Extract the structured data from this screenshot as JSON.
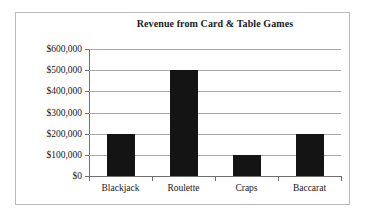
{
  "chart_data": {
    "type": "bar",
    "title": "Revenue from Card & Table Games",
    "xlabel": "",
    "ylabel": "",
    "categories": [
      "Blackjack",
      "Roulette",
      "Craps",
      "Baccarat"
    ],
    "values": [
      200000,
      500000,
      100000,
      200000
    ],
    "value_labels": [
      "$200,000",
      "$500,000",
      "$100,000",
      "$200,000"
    ],
    "ylim": [
      0,
      600000
    ],
    "ytick_values": [
      0,
      100000,
      200000,
      300000,
      400000,
      500000,
      600000
    ],
    "ytick_labels": [
      "$0",
      "$100,000",
      "$200,000",
      "$300,000",
      "$400,000",
      "$500,000",
      "$600,000"
    ],
    "grid": true,
    "legend": false,
    "legend_position": "none",
    "bar_color": "#141414",
    "gridline_color": "#a8a8a8",
    "axis_color": "#6f6f6f",
    "background_color": "#ffffff",
    "border_color": "#b9b9b9"
  }
}
